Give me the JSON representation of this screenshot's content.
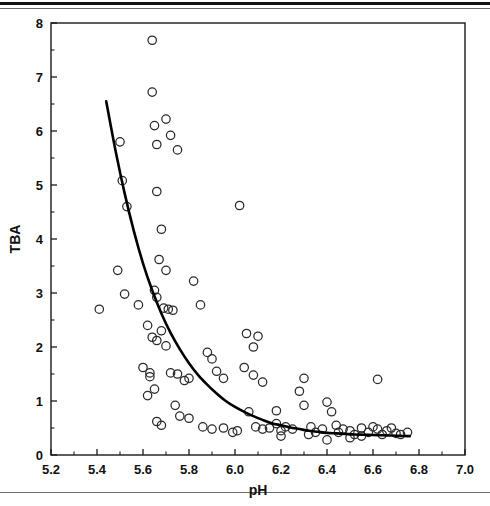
{
  "figure": {
    "rules": {
      "top_thick": "horizontal-rule",
      "top_thin": "horizontal-rule",
      "bottom": "horizontal-rule"
    }
  },
  "chart_data": {
    "type": "scatter",
    "title": "",
    "xlabel": "pH",
    "ylabel": "TBA",
    "xlim": [
      5.2,
      7.0
    ],
    "ylim": [
      0,
      8
    ],
    "xticks": [
      5.2,
      5.4,
      5.6,
      5.8,
      6.0,
      6.2,
      6.4,
      6.6,
      6.8,
      7.0
    ],
    "xticklabels": [
      "5.2",
      "5.4",
      "5.6",
      "5.8",
      "6.0",
      "6.2",
      "6.4",
      "6.6",
      "6.8",
      "7.0"
    ],
    "xminorticks": [
      5.3,
      5.5,
      5.7,
      5.9,
      6.1,
      6.3,
      6.5,
      6.7,
      6.9
    ],
    "yticks": [
      0,
      1,
      2,
      3,
      4,
      5,
      6,
      7,
      8
    ],
    "yticklabels": [
      "0",
      "1",
      "2",
      "3",
      "4",
      "5",
      "6",
      "7",
      "8"
    ],
    "yminorticks": [
      0.5,
      1.5,
      2.5,
      3.5,
      4.5,
      5.5,
      6.5,
      7.5
    ],
    "grid": false,
    "legend": false,
    "marker": "open-circle",
    "marker_size": 4.2,
    "point_color": "#2a2a2a",
    "curve_color": "#000000",
    "points": [
      [
        5.41,
        2.7
      ],
      [
        5.49,
        3.42
      ],
      [
        5.5,
        5.8
      ],
      [
        5.51,
        5.08
      ],
      [
        5.53,
        4.6
      ],
      [
        5.52,
        2.98
      ],
      [
        5.58,
        2.78
      ],
      [
        5.62,
        2.4
      ],
      [
        5.6,
        1.62
      ],
      [
        5.64,
        7.68
      ],
      [
        5.64,
        6.72
      ],
      [
        5.65,
        6.1
      ],
      [
        5.66,
        5.75
      ],
      [
        5.7,
        6.22
      ],
      [
        5.72,
        5.92
      ],
      [
        5.75,
        5.65
      ],
      [
        5.66,
        4.88
      ],
      [
        5.68,
        4.18
      ],
      [
        5.67,
        3.62
      ],
      [
        5.7,
        3.42
      ],
      [
        5.65,
        3.05
      ],
      [
        5.66,
        2.92
      ],
      [
        5.69,
        2.72
      ],
      [
        5.71,
        2.7
      ],
      [
        5.73,
        2.68
      ],
      [
        5.64,
        2.18
      ],
      [
        5.66,
        2.12
      ],
      [
        5.68,
        2.3
      ],
      [
        5.7,
        2.02
      ],
      [
        5.63,
        1.52
      ],
      [
        5.63,
        1.45
      ],
      [
        5.65,
        1.22
      ],
      [
        5.62,
        1.1
      ],
      [
        5.66,
        0.62
      ],
      [
        5.68,
        0.55
      ],
      [
        5.72,
        1.52
      ],
      [
        5.75,
        1.5
      ],
      [
        5.78,
        1.38
      ],
      [
        5.8,
        1.42
      ],
      [
        5.74,
        0.92
      ],
      [
        5.76,
        0.72
      ],
      [
        5.8,
        0.68
      ],
      [
        5.85,
        2.78
      ],
      [
        5.82,
        3.22
      ],
      [
        5.88,
        1.9
      ],
      [
        5.9,
        1.78
      ],
      [
        5.92,
        1.55
      ],
      [
        5.95,
        1.42
      ],
      [
        5.86,
        0.52
      ],
      [
        5.9,
        0.48
      ],
      [
        5.95,
        0.5
      ],
      [
        5.99,
        0.42
      ],
      [
        6.01,
        0.45
      ],
      [
        6.02,
        4.62
      ],
      [
        6.05,
        2.25
      ],
      [
        6.08,
        2.0
      ],
      [
        6.1,
        2.2
      ],
      [
        6.04,
        1.62
      ],
      [
        6.08,
        1.48
      ],
      [
        6.12,
        1.35
      ],
      [
        6.06,
        0.8
      ],
      [
        6.09,
        0.52
      ],
      [
        6.12,
        0.48
      ],
      [
        6.15,
        0.5
      ],
      [
        6.18,
        0.82
      ],
      [
        6.18,
        0.58
      ],
      [
        6.2,
        0.45
      ],
      [
        6.2,
        0.35
      ],
      [
        6.22,
        0.52
      ],
      [
        6.25,
        0.48
      ],
      [
        6.28,
        1.18
      ],
      [
        6.3,
        1.42
      ],
      [
        6.3,
        0.92
      ],
      [
        6.33,
        0.52
      ],
      [
        6.32,
        0.38
      ],
      [
        6.35,
        0.42
      ],
      [
        6.38,
        0.48
      ],
      [
        6.4,
        0.98
      ],
      [
        6.42,
        0.8
      ],
      [
        6.44,
        0.55
      ],
      [
        6.4,
        0.28
      ],
      [
        6.45,
        0.42
      ],
      [
        6.47,
        0.48
      ],
      [
        6.5,
        0.45
      ],
      [
        6.5,
        0.32
      ],
      [
        6.52,
        0.38
      ],
      [
        6.55,
        0.5
      ],
      [
        6.55,
        0.35
      ],
      [
        6.58,
        0.42
      ],
      [
        6.62,
        1.4
      ],
      [
        6.6,
        0.52
      ],
      [
        6.62,
        0.48
      ],
      [
        6.64,
        0.38
      ],
      [
        6.66,
        0.45
      ],
      [
        6.68,
        0.5
      ],
      [
        6.7,
        0.4
      ],
      [
        6.72,
        0.38
      ],
      [
        6.75,
        0.42
      ]
    ],
    "fit_curve": {
      "description": "exponential-decay-fit",
      "x_start": 5.44,
      "x_end": 6.76,
      "y_start": 6.55,
      "y_asymptote": 0.35,
      "points": [
        [
          5.44,
          6.55
        ],
        [
          5.48,
          5.65
        ],
        [
          5.52,
          4.85
        ],
        [
          5.56,
          4.15
        ],
        [
          5.6,
          3.55
        ],
        [
          5.64,
          3.05
        ],
        [
          5.68,
          2.62
        ],
        [
          5.72,
          2.26
        ],
        [
          5.76,
          1.96
        ],
        [
          5.8,
          1.7
        ],
        [
          5.84,
          1.48
        ],
        [
          5.88,
          1.3
        ],
        [
          5.92,
          1.14
        ],
        [
          5.96,
          1.0
        ],
        [
          6.0,
          0.89
        ],
        [
          6.04,
          0.8
        ],
        [
          6.08,
          0.72
        ],
        [
          6.12,
          0.65
        ],
        [
          6.16,
          0.59
        ],
        [
          6.2,
          0.55
        ],
        [
          6.24,
          0.51
        ],
        [
          6.28,
          0.48
        ],
        [
          6.32,
          0.45
        ],
        [
          6.36,
          0.43
        ],
        [
          6.4,
          0.41
        ],
        [
          6.44,
          0.4
        ],
        [
          6.48,
          0.39
        ],
        [
          6.52,
          0.38
        ],
        [
          6.56,
          0.375
        ],
        [
          6.6,
          0.37
        ],
        [
          6.64,
          0.365
        ],
        [
          6.68,
          0.36
        ],
        [
          6.72,
          0.355
        ],
        [
          6.76,
          0.35
        ]
      ]
    }
  }
}
